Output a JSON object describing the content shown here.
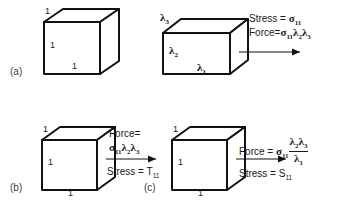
{
  "figure": {
    "background_color": "#ffffff",
    "line_color": "#111111",
    "text_color": "#1a1a1a",
    "width": 353,
    "height": 205
  },
  "panels": [
    {
      "id": "a",
      "label": "(a)",
      "cube": {
        "name": "unit-cube",
        "edge_labels": {
          "top": "1",
          "left": "1",
          "bottom": "1"
        }
      },
      "deformed_box": {
        "name": "deformed-box",
        "edge_labels": {
          "top_depth": "λ",
          "left_height": "λ",
          "bottom_width": "λ"
        },
        "lambda_3": {
          "base": "λ",
          "sub": "3"
        },
        "lambda_2": {
          "base": "λ",
          "sub": "2"
        },
        "lambda_1": {
          "base": "λ",
          "sub": "1"
        }
      },
      "annotations": {
        "stress_line": {
          "prefix": "Stress = ",
          "sym": "σ",
          "sub": "11"
        },
        "force_line": {
          "prefix": "Force=",
          "sym": "σ",
          "sub": "11",
          "factor1": "λ",
          "factor1_sub": "2",
          "factor2": "λ",
          "factor2_sub": "3"
        }
      },
      "arrow": {
        "name": "force-arrow-a",
        "direction": "right"
      }
    },
    {
      "id": "b",
      "label": "(b)",
      "cube": {
        "name": "unit-cube",
        "edge_labels": {
          "top": "1",
          "left": "1",
          "bottom": "1"
        }
      },
      "annotations": {
        "force_label": "Force=",
        "force_expr": {
          "sym": "σ",
          "sub": "11",
          "factor1": "λ",
          "factor1_sub": "2",
          "factor2": "λ",
          "factor2_sub": "3"
        },
        "stress_line": {
          "prefix": "Stress = ",
          "sym": "T",
          "sub": "11"
        }
      },
      "arrow": {
        "name": "force-arrow-b",
        "direction": "right"
      }
    },
    {
      "id": "c",
      "label": "(c)",
      "cube": {
        "name": "unit-cube",
        "edge_labels": {
          "top": "1",
          "left": "1",
          "bottom": "1"
        }
      },
      "annotations": {
        "force_label": "Force  =  ",
        "force_expr": {
          "sym": "σ",
          "sub": "11",
          "numerator1": "λ",
          "numerator1_sub": "2",
          "numerator2": "λ",
          "numerator2_sub": "3",
          "denominator": "λ",
          "denominator_sub": "1"
        },
        "stress_line": {
          "prefix": "Stress = ",
          "sym": "S",
          "sub": "11"
        }
      },
      "arrow": {
        "name": "force-arrow-c",
        "direction": "right"
      }
    }
  ]
}
